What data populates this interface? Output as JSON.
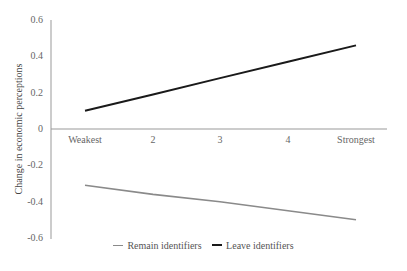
{
  "chart_data": {
    "type": "line",
    "title": "",
    "xlabel": "",
    "ylabel": "Change in economic perceptions",
    "categories": [
      "Weakest",
      "2",
      "3",
      "4",
      "Strongest"
    ],
    "ylim": [
      -0.6,
      0.6
    ],
    "yticks": [
      "0.6",
      "0.4",
      "0.2",
      "0",
      "-0.2",
      "-0.4",
      "-0.6"
    ],
    "grid": false,
    "legend_position": "bottom",
    "series": [
      {
        "name": "Remain identifiers",
        "color": "#8a8a8a",
        "values": [
          -0.31,
          -0.36,
          -0.4,
          -0.45,
          -0.5
        ]
      },
      {
        "name": "Leave identifiers",
        "color": "#1a1a1a",
        "values": [
          0.1,
          0.19,
          0.28,
          0.37,
          0.46
        ]
      }
    ]
  },
  "legend": {
    "remain_label": "Remain identifiers",
    "leave_label": "Leave identifiers"
  }
}
